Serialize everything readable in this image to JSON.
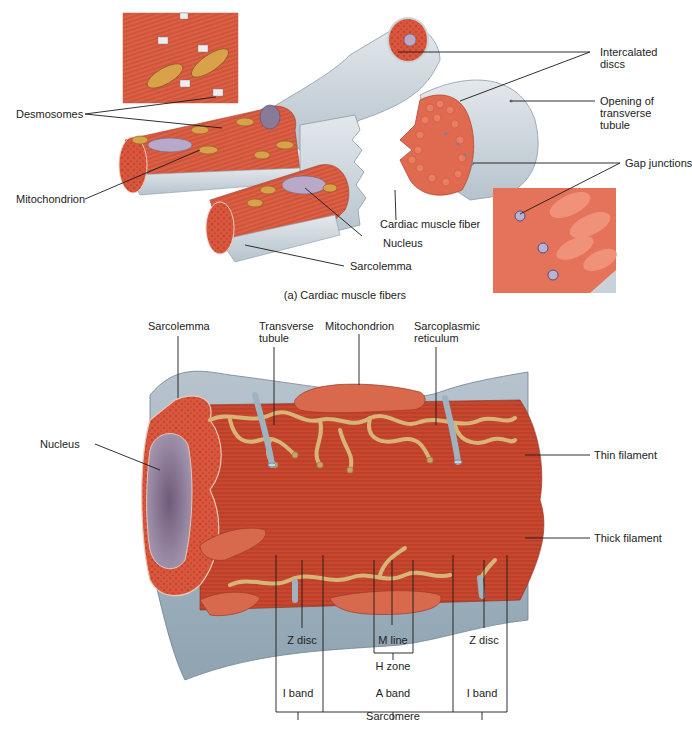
{
  "figure": {
    "panel_a": {
      "caption": "(a) Cardiac muscle fibers",
      "labels": {
        "desmosomes": "Desmosomes",
        "mitochondrion": "Mitochondrion",
        "intercalated_discs_1": "Intercalated",
        "intercalated_discs_2": "discs",
        "opening_t_tubule_1": "Opening of",
        "opening_t_tubule_2": "transverse",
        "opening_t_tubule_3": "tubule",
        "gap_junctions": "Gap junctions",
        "cardiac_muscle_fiber": "Cardiac muscle fiber",
        "nucleus": "Nucleus",
        "sarcolemma": "Sarcolemma"
      }
    },
    "panel_b": {
      "labels": {
        "sarcolemma": "Sarcolemma",
        "transverse_tubule_1": "Transverse",
        "transverse_tubule_2": "tubule",
        "mitochondrion": "Mitochondrion",
        "sarcoplasmic_reticulum_1": "Sarcoplasmic",
        "sarcoplasmic_reticulum_2": "reticulum",
        "nucleus": "Nucleus",
        "thin_filament": "Thin filament",
        "thick_filament": "Thick filament",
        "z_disc_left": "Z disc",
        "m_line": "M line",
        "z_disc_right": "Z disc",
        "h_zone": "H zone",
        "i_band_left": "I band",
        "a_band": "A band",
        "i_band_right": "I band",
        "sarcomere": "Sarcomere"
      }
    }
  },
  "colors": {
    "muscle": "#d9563c",
    "muscle_dark": "#b8452f",
    "membrane": "#c9d2d8",
    "membrane_dark": "#9fb0bb",
    "mitochondria": "#d9a24a",
    "nucleus": "#b9a9c9",
    "sr": "#d8b577",
    "t_tubule": "#9fb2c0"
  }
}
